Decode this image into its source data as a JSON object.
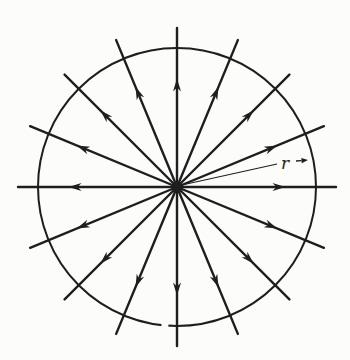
{
  "figure": {
    "radius_label": "r",
    "ink_color": "#1e1e1e",
    "background_color": "#fcfcfb",
    "center_x": 177,
    "center_y": 187,
    "circle_radius": 139,
    "circle_stroke_width": 2,
    "circle_gap": {
      "angle_deg": 265,
      "length": 7
    },
    "num_rays": 16,
    "ray_start_angle_deg": 0,
    "ray_step_deg": 22.5,
    "ray_length": 159,
    "ray_stroke_width": 2.4,
    "arrow_distance": 102,
    "arrow_length": 13,
    "arrow_half_width": 4,
    "arrow_notch_factor": 0.3,
    "center_dot_radius": 5.5,
    "leader_line": {
      "x1": 182,
      "y1": 185,
      "x2": 277,
      "y2": 164,
      "stroke_width": 1.1
    },
    "label_x": 281,
    "label_y": 169,
    "label_font_size": 17,
    "label_arrow": {
      "x1": 296,
      "y1": 161,
      "x2": 308,
      "y2": 160,
      "stroke_width": 1.3,
      "head_length": 6.5,
      "head_half_width": 2.6
    }
  }
}
